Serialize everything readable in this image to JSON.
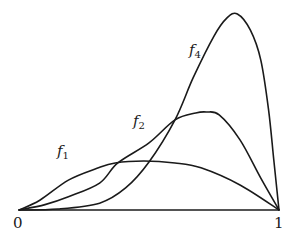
{
  "chart_data": {
    "type": "line",
    "title": "",
    "xlabel": "",
    "ylabel": "",
    "xlim": [
      0,
      1
    ],
    "ylim": [
      0,
      4.1
    ],
    "grid": false,
    "legend": "inline labels on curves",
    "x_ticks": [
      "0",
      "1"
    ],
    "series": [
      {
        "name": "f1",
        "label_text": "f",
        "label_sub": "1",
        "points": [
          [
            0,
            0
          ],
          [
            0.08,
            0.2
          ],
          [
            0.19,
            0.61
          ],
          [
            0.3,
            0.85
          ],
          [
            0.37,
            0.96
          ],
          [
            0.48,
            1.0
          ],
          [
            0.6,
            0.96
          ],
          [
            0.7,
            0.86
          ],
          [
            0.85,
            0.51
          ],
          [
            1,
            0
          ]
        ]
      },
      {
        "name": "f2",
        "label_text": "f",
        "label_sub": "2",
        "points": [
          [
            0,
            0
          ],
          [
            0.1,
            0.11
          ],
          [
            0.19,
            0.27
          ],
          [
            0.31,
            0.55
          ],
          [
            0.38,
            0.96
          ],
          [
            0.5,
            1.37
          ],
          [
            0.6,
            1.84
          ],
          [
            0.68,
            1.98
          ],
          [
            0.72,
            2.0
          ],
          [
            0.77,
            1.94
          ],
          [
            0.85,
            1.43
          ],
          [
            0.93,
            0.65
          ],
          [
            1,
            0
          ]
        ]
      },
      {
        "name": "f4",
        "label_text": "f",
        "label_sub": "4",
        "points": [
          [
            0,
            0
          ],
          [
            0.15,
            0.02
          ],
          [
            0.31,
            0.14
          ],
          [
            0.41,
            0.45
          ],
          [
            0.5,
            0.98
          ],
          [
            0.6,
            1.84
          ],
          [
            0.67,
            2.7
          ],
          [
            0.75,
            3.55
          ],
          [
            0.8,
            3.92
          ],
          [
            0.84,
            4.0
          ],
          [
            0.89,
            3.67
          ],
          [
            0.93,
            3.06
          ],
          [
            0.96,
            2.04
          ],
          [
            0.98,
            1.02
          ],
          [
            1,
            0
          ]
        ]
      }
    ]
  },
  "labels": {
    "x0": "0",
    "x1": "1"
  },
  "plot": {
    "x0_px": 19,
    "x1_px": 279,
    "baseline_px": 210,
    "unit_px": 49,
    "stroke": "#1a1a1a"
  }
}
